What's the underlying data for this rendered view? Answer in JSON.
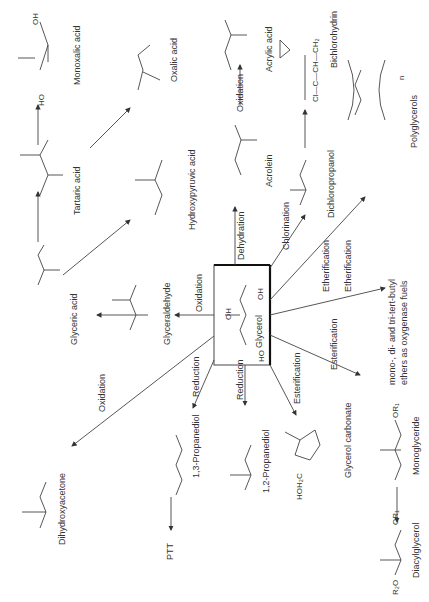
{
  "center": {
    "compound": "Glycerol"
  },
  "compounds": {
    "mesoxalic": "Monoxalic acid",
    "oxalic": "Oxalic acid",
    "tartaric": "Tartaric acid",
    "hydroxypyruvic": "Hydroxypyruvic acid",
    "glyceric": "Glyceric acid",
    "glyceraldehyde": "Glyceraldehyde",
    "dihydroxyacetone": "Dihydroxyacetone",
    "propanediol13": "1,3-Propanediol",
    "ptt": "PTT",
    "propanediol12": "1,2-Propanediol",
    "glycerol_carbonate": "Glycerol carbonate",
    "monoglyceride": "Monoglyceride",
    "diacylglycerol": "Diacylglycerol",
    "ethers": [
      "mono-, di- and tri-tert-butyl",
      "ethers as oxygenase fuels"
    ],
    "polyglycerols": "Polyglycerols",
    "dichloropropanol": "Dichloropropanol",
    "epichlorohydrin": "Bichlorohydrin",
    "acrolein": "Acrolein",
    "acrylic": "Acrylic acid"
  },
  "reactions": {
    "oxidation_glyceraldehyde": "Oxidation",
    "oxidation_dha": "Oxidation",
    "reduction_13": "Reduction",
    "reduction_12": "Reduction",
    "esterification_carbonate": "Esterification",
    "esterification_mono": "Esterification",
    "etherification_1": "Etherification",
    "etherification_2": "Etherification",
    "chlorination": "Chlorination",
    "dehydration": "Dehydration",
    "oxidation_acrylic": "Oxidation"
  },
  "atoms": {
    "OH": "OH",
    "HO": "HO",
    "O": "O",
    "H": "H",
    "Cl": "Cl",
    "OR1": "OR₁",
    "R2O": "R₂O",
    "HOH2C": "HOH₂C",
    "H2": "H₂",
    "CH2": "CH₂",
    "ClCCH": "Cl—C—CH—CH₂",
    "n": "n"
  }
}
